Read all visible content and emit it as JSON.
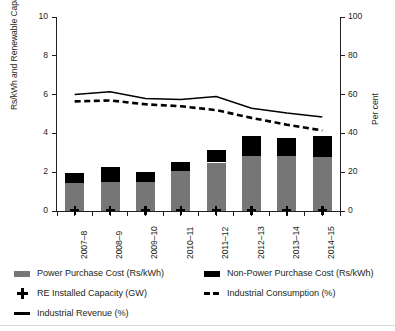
{
  "chart_data": {
    "type": "bar",
    "title": "",
    "subtitle": "",
    "xlabel": "",
    "ylabel": "Rs/kWh and Renewable Capacity (in GW)",
    "ylabel_right": "Per cent",
    "ylim": [
      0,
      10
    ],
    "ylim_right": [
      0,
      100
    ],
    "yticks": [
      0,
      2,
      4,
      6,
      8,
      10
    ],
    "yticks_right": [
      0,
      20,
      40,
      60,
      80,
      100
    ],
    "grid": false,
    "legend_position": "below",
    "categories": [
      "2007–8",
      "2008–9",
      "2009–10",
      "2010–11",
      "2011–12",
      "2012–13",
      "2013–14",
      "2014–15"
    ],
    "series": [
      {
        "name": "Power Purchase Cost (Rs/kWh)",
        "type": "bar-stacked-lower",
        "axis": "left",
        "color": "#767676",
        "values": [
          1.45,
          1.5,
          1.5,
          2.05,
          2.5,
          2.85,
          2.85,
          2.8
        ]
      },
      {
        "name": "Non-Power Purchase Cost (Rs/kWh)",
        "type": "bar-stacked-upper",
        "axis": "left",
        "color": "#000000",
        "values": [
          0.5,
          0.75,
          0.5,
          0.5,
          0.65,
          1.0,
          0.9,
          1.05
        ]
      },
      {
        "name": "RE Installed Capacity (GW)",
        "type": "scatter",
        "axis": "left",
        "marker": "plus",
        "color": "#000000",
        "values": [
          0.05,
          0.05,
          0.05,
          0.05,
          0.05,
          0.05,
          0.05,
          0.05
        ]
      },
      {
        "name": "Industrial Consumption (%)",
        "type": "line-dashed",
        "axis": "right",
        "color": "#000000",
        "values": [
          56.5,
          57.0,
          55.0,
          54.0,
          52.0,
          48.0,
          44.5,
          41.5
        ]
      },
      {
        "name": "Industrial Revenue (%)",
        "type": "line-solid",
        "axis": "right",
        "color": "#000000",
        "values": [
          60.0,
          61.5,
          58.0,
          57.5,
          59.0,
          53.0,
          50.5,
          48.5
        ]
      }
    ],
    "stacked_totals": [
      1.95,
      2.25,
      2.0,
      2.55,
      3.15,
      3.85,
      3.75,
      3.85
    ]
  },
  "axes": {
    "left_title": "Rs/kWh and Renewable Capacity (in GW)",
    "right_title": "Per cent",
    "left_ticks": [
      "10",
      "8",
      "6",
      "4",
      "2",
      "0"
    ],
    "right_ticks": [
      "100",
      "80",
      "60",
      "40",
      "20",
      "0"
    ]
  },
  "xaxis": {
    "labels": [
      "2007–8",
      "2008–9",
      "2009–10",
      "2010–11",
      "2011–12",
      "2012–13",
      "2013–14",
      "2014–15"
    ]
  },
  "legend": {
    "items": [
      {
        "label": "Power Purchase Cost (Rs/kWh)",
        "marker": "grey-swatch-icon"
      },
      {
        "label": "Non-Power Purchase Cost (Rs/kWh)",
        "marker": "black-swatch-icon"
      },
      {
        "label": "RE Installed Capacity (GW)",
        "marker": "plus-marker-icon"
      },
      {
        "label": "Industrial Consumption (%)",
        "marker": "dashed-line-icon"
      },
      {
        "label": "Industrial Revenue (%)",
        "marker": "solid-line-icon"
      }
    ]
  },
  "colors": {
    "power_purchase_cost": "#767676",
    "non_power_purchase_cost": "#000000",
    "axis": "#231f20",
    "background": "#ffffff"
  }
}
